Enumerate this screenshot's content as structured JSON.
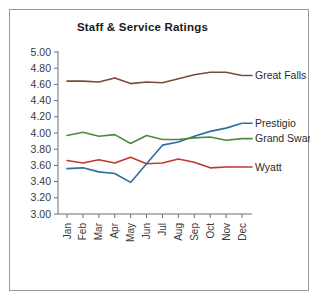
{
  "chart_data": {
    "type": "line",
    "title": "Staff & Service Ratings",
    "xlabel": "",
    "ylabel": "",
    "grid": false,
    "legend_position": "right-inline-labels",
    "categories": [
      "Jan",
      "Feb",
      "Mar",
      "Apr",
      "May",
      "Jun",
      "Jul",
      "Aug",
      "Sep",
      "Oct",
      "Nov",
      "Dec"
    ],
    "ylim": [
      3.0,
      5.0
    ],
    "ytick_step": 0.2,
    "ytick_labels": [
      "3.00",
      "3.20",
      "3.40",
      "3.60",
      "3.80",
      "4.00",
      "4.20",
      "4.40",
      "4.60",
      "4.80",
      "5.00"
    ],
    "series": [
      {
        "name": "Great Falls",
        "color": "#7B4B3A",
        "values": [
          4.64,
          4.64,
          4.63,
          4.68,
          4.61,
          4.63,
          4.62,
          4.67,
          4.72,
          4.75,
          4.75,
          4.71
        ]
      },
      {
        "name": "Prestigio",
        "color": "#2E6DA4",
        "values": [
          3.56,
          3.57,
          3.52,
          3.5,
          3.39,
          3.62,
          3.85,
          3.89,
          3.96,
          4.02,
          4.06,
          4.12
        ]
      },
      {
        "name": "Grand Swan",
        "color": "#4C8A3F",
        "values": [
          3.97,
          4.01,
          3.96,
          3.98,
          3.87,
          3.97,
          3.92,
          3.92,
          3.94,
          3.95,
          3.91,
          3.93
        ]
      },
      {
        "name": "Wyatt",
        "color": "#C0392B",
        "values": [
          3.66,
          3.63,
          3.67,
          3.63,
          3.7,
          3.62,
          3.63,
          3.68,
          3.64,
          3.57,
          3.58,
          3.58
        ]
      }
    ]
  },
  "chart": {
    "title": "Staff & Service Ratings"
  }
}
